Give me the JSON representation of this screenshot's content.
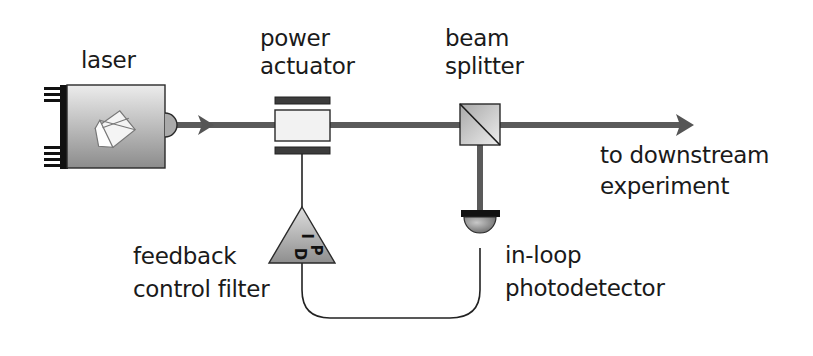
{
  "diagram": {
    "components": {
      "laser": {
        "label_lines": [
          "laser"
        ]
      },
      "power_actuator": {
        "label_lines": [
          "power",
          "actuator"
        ]
      },
      "beam_splitter": {
        "label_lines": [
          "beam",
          "splitter"
        ]
      },
      "output": {
        "label_lines": [
          "to downstream",
          "experiment"
        ]
      },
      "feedback_filter": {
        "label_lines": [
          "feedback",
          "control filter"
        ],
        "symbol_letters": [
          "I",
          "P",
          "D"
        ]
      },
      "photodetector": {
        "label_lines": [
          "in-loop",
          "photodetector"
        ]
      }
    },
    "connections": [
      {
        "from": "laser",
        "to": "power_actuator",
        "type": "optical-beam"
      },
      {
        "from": "power_actuator",
        "to": "beam_splitter",
        "type": "optical-beam"
      },
      {
        "from": "beam_splitter",
        "to": "output",
        "type": "optical-beam"
      },
      {
        "from": "beam_splitter",
        "to": "photodetector",
        "type": "optical-beam"
      },
      {
        "from": "photodetector",
        "to": "feedback_filter",
        "type": "electrical-wire"
      },
      {
        "from": "feedback_filter",
        "to": "power_actuator",
        "type": "electrical-wire"
      }
    ],
    "colors": {
      "beam": "#5a5a5a",
      "wire": "#222222",
      "outline": "#2a2a2a",
      "component_dark": "#8a8a8a",
      "component_light": "#eeeeee",
      "actuator_bars": "#3c3c3c"
    }
  }
}
